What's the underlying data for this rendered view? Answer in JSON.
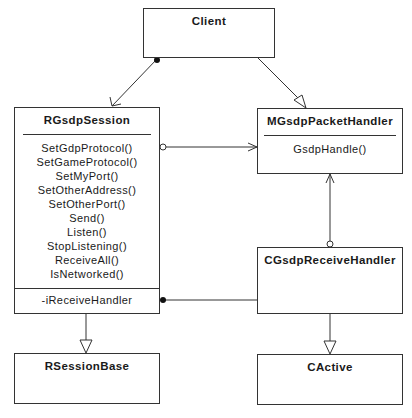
{
  "classes": {
    "client": {
      "name": "Client"
    },
    "session": {
      "name": "RGsdpSession",
      "operations": [
        "SetGdpProtocol()",
        "SetGameProtocol()",
        "SetMyPort()",
        "SetOtherAddress()",
        "SetOtherPort()",
        "Send()",
        "Listen()",
        "StopListening()",
        "ReceiveAll()",
        "IsNetworked()"
      ],
      "attributes": [
        "-iReceiveHandler"
      ]
    },
    "packet_handler": {
      "name": "MGsdpPacketHandler",
      "operations": [
        "GsdpHandle()"
      ]
    },
    "receive_handler": {
      "name": "CGsdpReceiveHandler"
    },
    "session_base": {
      "name": "RSessionBase"
    },
    "active": {
      "name": "CActive"
    }
  },
  "relationships": [
    {
      "from": "Client",
      "to": "RGsdpSession",
      "type": "composition-association"
    },
    {
      "from": "Client",
      "to": "MGsdpPacketHandler",
      "type": "generalization"
    },
    {
      "from": "RGsdpSession",
      "to": "MGsdpPacketHandler",
      "type": "aggregation-association"
    },
    {
      "from": "CGsdpReceiveHandler",
      "to": "MGsdpPacketHandler",
      "type": "aggregation-association"
    },
    {
      "from": "RGsdpSession",
      "to": "CGsdpReceiveHandler",
      "type": "composition"
    },
    {
      "from": "RGsdpSession",
      "to": "RSessionBase",
      "type": "generalization"
    },
    {
      "from": "CGsdpReceiveHandler",
      "to": "CActive",
      "type": "generalization"
    }
  ]
}
